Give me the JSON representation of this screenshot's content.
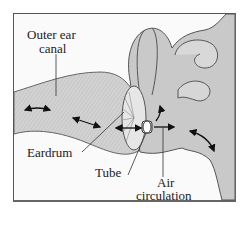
{
  "diagram": {
    "labels": {
      "outer_ear_canal_line1": "Outer ear",
      "outer_ear_canal_line2": "canal",
      "eardrum": "Eardrum",
      "tube": "Tube",
      "air_circulation_line1": "Air",
      "air_circulation_line2": "circulation"
    },
    "icons": [
      "double-headed-arrow",
      "single-arrow",
      "curved-arrow"
    ],
    "colors": {
      "background": "#fafafa",
      "tissue": "#c8c8c8",
      "tissue_light": "#dcdcdc",
      "outline": "#555555",
      "text": "#222222",
      "arrow": "#111111"
    }
  }
}
